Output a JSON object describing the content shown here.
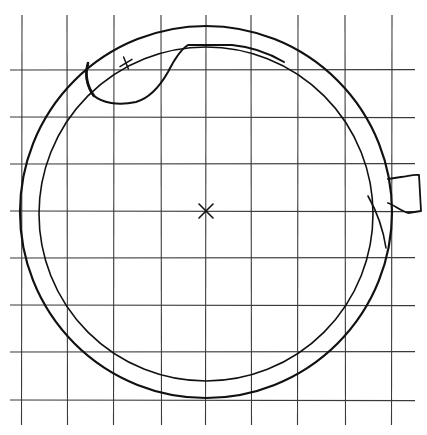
{
  "diagram": {
    "grid": {
      "vertical_x": [
        22,
        67,
        114,
        161,
        206,
        251,
        298,
        345,
        392
      ],
      "horizontal_y": [
        70,
        117,
        164,
        211,
        258,
        305,
        352,
        400
      ],
      "extent": {
        "x_min": 10,
        "x_max": 415,
        "y_min": 15,
        "y_max": 425
      }
    },
    "outer_circle": {
      "cx": 206,
      "cy": 212,
      "r": 186
    },
    "inner_circle": {
      "cx": 206,
      "cy": 214,
      "r": 167
    },
    "center_mark": {
      "type": "x-cross",
      "x": 206,
      "y": 211,
      "size": 7
    },
    "plus_mark": {
      "type": "plus-cross",
      "x": 126,
      "y": 63,
      "size": 6
    },
    "colors": {
      "ink": "#111111",
      "grid": "#3a3a3a",
      "paper": "#ffffff"
    }
  }
}
